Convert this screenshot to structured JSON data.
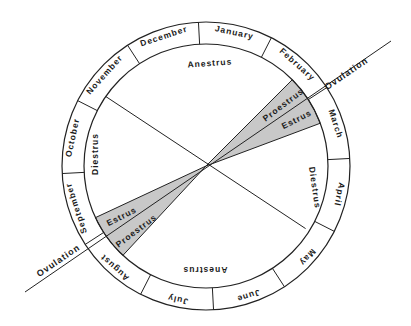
{
  "diagram": {
    "center": [
      206,
      166
    ],
    "outer_radius": 144,
    "inner_radius": 122,
    "colors": {
      "line": "#222222",
      "wedge_fill": "#c8c8c8",
      "background": "#ffffff"
    },
    "months": [
      {
        "label": "January",
        "start": -93
      },
      {
        "label": "February",
        "start": -63
      },
      {
        "label": "March",
        "start": -33
      },
      {
        "label": "April",
        "start": -3
      },
      {
        "label": "May",
        "start": 27
      },
      {
        "label": "June",
        "start": 57
      },
      {
        "label": "July",
        "start": 87
      },
      {
        "label": "August",
        "start": 117
      },
      {
        "label": "September",
        "start": 147
      },
      {
        "label": "October",
        "start": 177
      },
      {
        "label": "November",
        "start": 207
      },
      {
        "label": "December",
        "start": 237
      }
    ],
    "phases": [
      {
        "label": "Anestrus",
        "position": "top"
      },
      {
        "label": "Diestrus",
        "position": "right"
      },
      {
        "label": "Anestrus",
        "position": "bottom"
      },
      {
        "label": "Diestrus",
        "position": "left"
      },
      {
        "label": "Proestrus",
        "position": "upper-right-wedge"
      },
      {
        "label": "Estrus",
        "position": "upper-right-wedge"
      },
      {
        "label": "Estrus",
        "position": "lower-left-wedge"
      },
      {
        "label": "Proestrus",
        "position": "lower-left-wedge"
      }
    ],
    "ovulation": [
      {
        "label": "Ovulation",
        "position": "upper-right"
      },
      {
        "label": "Ovulation",
        "position": "lower-left"
      }
    ]
  }
}
